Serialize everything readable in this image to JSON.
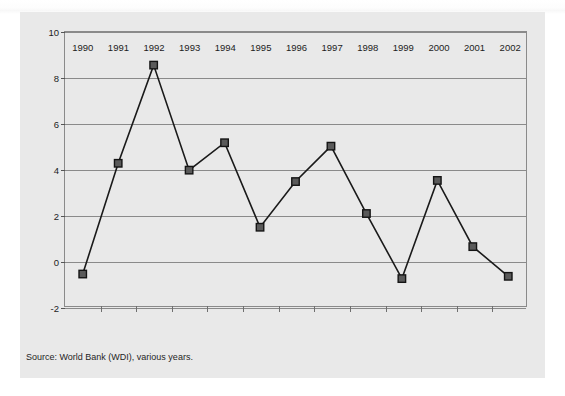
{
  "figure": {
    "source_note": "Source: World Bank (WDI), various years.",
    "panel_background": "#e9e9e9",
    "frame_color": "#8a8a8a",
    "marker_fill": "#5a5a5a",
    "marker_stroke": "#141414",
    "line_color": "#1a1a1a"
  },
  "chart_data": {
    "type": "line",
    "title": "",
    "subtitle": "",
    "xlabel": "",
    "ylabel": "",
    "categories": [
      "1990",
      "1991",
      "1992",
      "1993",
      "1994",
      "1995",
      "1996",
      "1997",
      "1998",
      "1999",
      "2000",
      "2001",
      "2002"
    ],
    "values": [
      -0.6,
      4.25,
      8.55,
      3.95,
      5.15,
      1.45,
      3.45,
      5.0,
      2.05,
      -0.8,
      3.5,
      0.6,
      -0.7
    ],
    "series": [
      {
        "name": "GDP growth (annual %)",
        "values": [
          -0.6,
          4.25,
          8.55,
          3.95,
          5.15,
          1.45,
          3.45,
          5.0,
          2.05,
          -0.8,
          3.5,
          0.6,
          -0.7
        ]
      }
    ],
    "ylim": [
      -2,
      10
    ],
    "yticks": [
      10,
      8,
      6,
      4,
      2,
      0,
      -2
    ],
    "ytick_labels": [
      "10",
      "8",
      "6",
      "4",
      "2",
      "0",
      "-2"
    ],
    "xtick_labels": [
      "1990",
      "1991",
      "1992",
      "1993",
      "1994",
      "1995",
      "1996",
      "1997",
      "1998",
      "1999",
      "2000",
      "2001",
      "2002"
    ],
    "grid": true,
    "grid_axis": "y",
    "legend": false,
    "legend_position": "none",
    "marker": "square",
    "annotations": []
  }
}
